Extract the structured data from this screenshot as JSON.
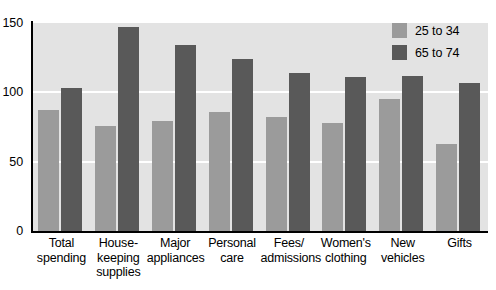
{
  "chart_data": {
    "type": "bar",
    "title": "",
    "xlabel": "",
    "ylabel": "",
    "ylim": [
      0,
      150
    ],
    "yticks": [
      0,
      50,
      100,
      150
    ],
    "grid": true,
    "legend_position": "top-right",
    "categories": [
      "Total spending",
      "House-keeping supplies",
      "Major appliances",
      "Personal care",
      "Fees/ admissions",
      "Women's clothing",
      "New vehicles",
      "Gifts"
    ],
    "category_lines": [
      [
        "Total",
        "spending"
      ],
      [
        "House-",
        "keeping",
        "supplies"
      ],
      [
        "Major",
        "appliances"
      ],
      [
        "Personal",
        "care"
      ],
      [
        "Fees/",
        "admissions"
      ],
      [
        "Women's",
        "clothing"
      ],
      [
        "New",
        "vehicles"
      ],
      [
        "Gifts"
      ]
    ],
    "series": [
      {
        "name": "25 to 34",
        "color": "#9b9b9b",
        "values": [
          87,
          76,
          79,
          86,
          82,
          78,
          95,
          63
        ]
      },
      {
        "name": "65 to 74",
        "color": "#595959",
        "values": [
          103,
          147,
          134,
          124,
          114,
          111,
          112,
          107
        ]
      }
    ]
  },
  "axis": {
    "y_tick_labels": [
      "150",
      "100",
      "50",
      "0"
    ]
  },
  "legend": {
    "items": [
      {
        "label": "25 to 34",
        "color": "#9b9b9b"
      },
      {
        "label": "65 to 74",
        "color": "#595959"
      }
    ]
  },
  "colors": {
    "plot_background": "#e3e3e3",
    "gridline": "#ffffff",
    "axis": "#000000",
    "page_background": "#ffffff"
  }
}
